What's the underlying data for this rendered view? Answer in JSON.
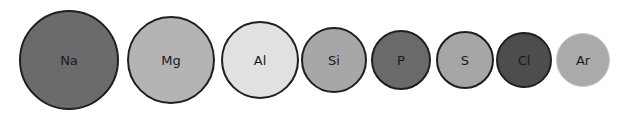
{
  "atoms": [
    {
      "symbol": "Na",
      "cx": 69,
      "cy": 60,
      "r": 50,
      "fill": "#6b6b6b",
      "stroke": "#1f1f1f",
      "stroke_width": 2
    },
    {
      "symbol": "Mg",
      "cx": 171,
      "cy": 60,
      "r": 44,
      "fill": "#b4b4b4",
      "stroke": "#1f1f1f",
      "stroke_width": 2
    },
    {
      "symbol": "Al",
      "cx": 260,
      "cy": 60,
      "r": 39,
      "fill": "#e1e1e1",
      "stroke": "#1f1f1f",
      "stroke_width": 2
    },
    {
      "symbol": "Si",
      "cx": 334,
      "cy": 60,
      "r": 33,
      "fill": "#a7a7a7",
      "stroke": "#1f1f1f",
      "stroke_width": 2
    },
    {
      "symbol": "P",
      "cx": 401,
      "cy": 60,
      "r": 30,
      "fill": "#6a6a6a",
      "stroke": "#1f1f1f",
      "stroke_width": 2
    },
    {
      "symbol": "S",
      "cx": 465,
      "cy": 60,
      "r": 29,
      "fill": "#a6a6a6",
      "stroke": "#1f1f1f",
      "stroke_width": 2
    },
    {
      "symbol": "Cl",
      "cx": 524,
      "cy": 60,
      "r": 28,
      "fill": "#4d4d4d",
      "stroke": "#1f1f1f",
      "stroke_width": 2
    },
    {
      "symbol": "Ar",
      "cx": 583,
      "cy": 60,
      "r": 27,
      "fill": "#aaaaaa",
      "stroke": "#c8c8c8",
      "stroke_width": 1
    }
  ]
}
